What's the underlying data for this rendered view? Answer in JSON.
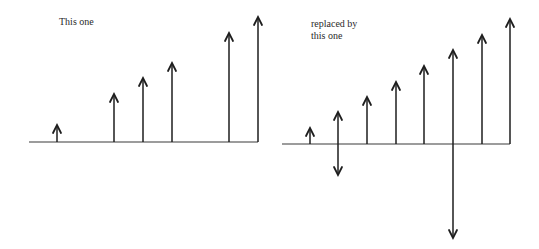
{
  "panels": [
    {
      "id": "left",
      "caption_lines": [
        "This one"
      ],
      "caption_pos": {
        "x": 59,
        "y": 16
      },
      "axis": {
        "x1": 29,
        "x2": 258,
        "y": 142
      },
      "arrows": [
        {
          "x": 57,
          "top": 125,
          "bottom": 142,
          "double": false
        },
        {
          "x": 114,
          "top": 94,
          "bottom": 142,
          "double": false
        },
        {
          "x": 143,
          "top": 78,
          "bottom": 142,
          "double": false
        },
        {
          "x": 172,
          "top": 63,
          "bottom": 142,
          "double": false
        },
        {
          "x": 229,
          "top": 33,
          "bottom": 142,
          "double": false
        },
        {
          "x": 258,
          "top": 17,
          "bottom": 142,
          "double": false
        }
      ]
    },
    {
      "id": "right",
      "caption_lines": [
        "replaced by",
        "this one"
      ],
      "caption_pos": {
        "x": 311,
        "y": 18
      },
      "axis": {
        "x1": 282,
        "x2": 510,
        "y": 144
      },
      "arrows": [
        {
          "x": 310,
          "top": 128,
          "bottom": 144,
          "double": false
        },
        {
          "x": 338,
          "top": 112,
          "bottom": 175,
          "double": true
        },
        {
          "x": 367,
          "top": 97,
          "bottom": 144,
          "double": false
        },
        {
          "x": 396,
          "top": 82,
          "bottom": 144,
          "double": false
        },
        {
          "x": 424,
          "top": 66,
          "bottom": 144,
          "double": false
        },
        {
          "x": 453,
          "top": 50,
          "bottom": 238,
          "double": true
        },
        {
          "x": 482,
          "top": 35,
          "bottom": 144,
          "double": false
        },
        {
          "x": 510,
          "top": 19,
          "bottom": 144,
          "double": false
        }
      ]
    }
  ],
  "colors": {
    "stroke": "#1e1e1e",
    "axis": "#3a3a3a",
    "text": "#2a2a2a",
    "background": "#ffffff"
  }
}
